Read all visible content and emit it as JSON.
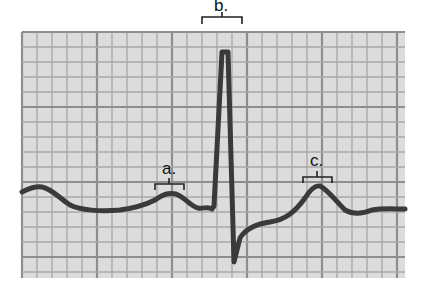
{
  "figure": {
    "type": "ECG waveform on grid paper",
    "labels": [
      {
        "id": "a",
        "text": "a.",
        "wave": "P wave"
      },
      {
        "id": "b",
        "text": "b.",
        "wave": "QRS complex"
      },
      {
        "id": "c",
        "text": "c.",
        "wave": "T wave"
      }
    ],
    "colors": {
      "paper": "#dcdcdc",
      "minor_grid": "#a9a9a9",
      "major_grid": "#8e8e8e",
      "trace": "#3a3a3a",
      "bracket": "#222222"
    },
    "grid": {
      "x0": 22,
      "y0": 32,
      "x1": 405,
      "y1": 278,
      "minor_step": 15,
      "major_every": 5
    }
  }
}
